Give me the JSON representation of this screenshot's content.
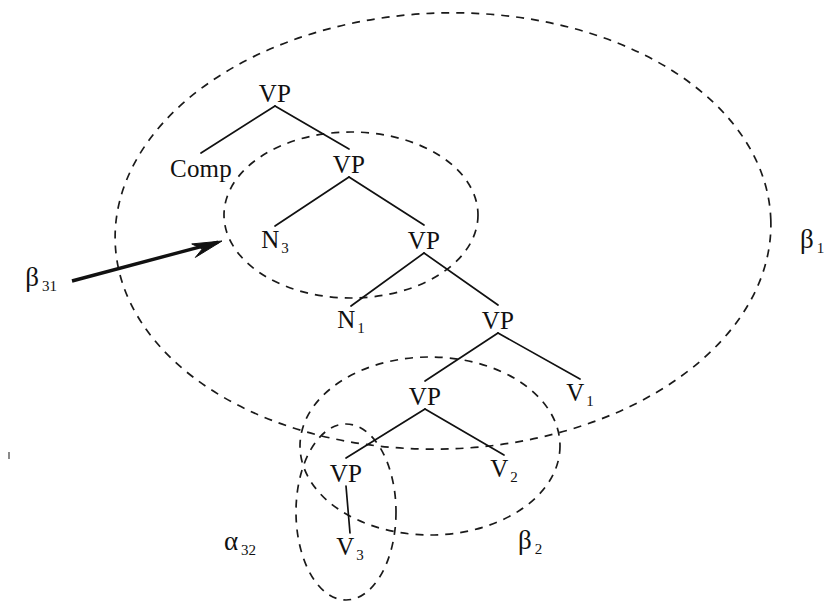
{
  "figure": {
    "background_color": "#ffffff",
    "ink_color": "#111111",
    "width": 840,
    "height": 613
  },
  "tree_nodes": [
    {
      "id": "vp-root",
      "label": "VP",
      "sub": "",
      "x": 275,
      "y": 93
    },
    {
      "id": "comp",
      "label": "Comp",
      "sub": "",
      "x": 201,
      "y": 168
    },
    {
      "id": "vp-2",
      "label": "VP",
      "sub": "",
      "x": 349,
      "y": 164
    },
    {
      "id": "n3",
      "label": "N",
      "sub": "3",
      "x": 275,
      "y": 241
    },
    {
      "id": "vp-3",
      "label": "VP",
      "sub": "",
      "x": 424,
      "y": 240
    },
    {
      "id": "n1",
      "label": "N",
      "sub": "1",
      "x": 351,
      "y": 321
    },
    {
      "id": "vp-4",
      "label": "VP",
      "sub": "",
      "x": 498,
      "y": 320
    },
    {
      "id": "vp-5",
      "label": "VP",
      "sub": "",
      "x": 425,
      "y": 396
    },
    {
      "id": "v1",
      "label": "V",
      "sub": "1",
      "x": 580,
      "y": 394
    },
    {
      "id": "vp-6",
      "label": "VP",
      "sub": "",
      "x": 346,
      "y": 473
    },
    {
      "id": "v2",
      "label": "V",
      "sub": "2",
      "x": 504,
      "y": 470
    },
    {
      "id": "v3",
      "label": "V",
      "sub": "3",
      "x": 350,
      "y": 548
    }
  ],
  "tree_edges": [
    {
      "id": "edge-vproot-comp",
      "from": "vp-root",
      "to": "comp"
    },
    {
      "id": "edge-vproot-vp2",
      "from": "vp-root",
      "to": "vp-2"
    },
    {
      "id": "edge-vp2-n3",
      "from": "vp-2",
      "to": "n3"
    },
    {
      "id": "edge-vp2-vp3",
      "from": "vp-2",
      "to": "vp-3"
    },
    {
      "id": "edge-vp3-n1",
      "from": "vp-3",
      "to": "n1"
    },
    {
      "id": "edge-vp3-vp4",
      "from": "vp-3",
      "to": "vp-4"
    },
    {
      "id": "edge-vp4-vp5",
      "from": "vp-4",
      "to": "vp-5"
    },
    {
      "id": "edge-vp4-v1",
      "from": "vp-4",
      "to": "v1"
    },
    {
      "id": "edge-vp5-vp6",
      "from": "vp-5",
      "to": "vp-6"
    },
    {
      "id": "edge-vp5-v2",
      "from": "vp-5",
      "to": "v2"
    },
    {
      "id": "edge-vp6-v3",
      "from": "vp-6",
      "to": "v3"
    }
  ],
  "regions": [
    {
      "id": "beta1",
      "name": "beta-1-region",
      "cx": 443,
      "cy": 231,
      "rx": 328,
      "ry": 218,
      "rotate": -2
    },
    {
      "id": "beta31",
      "name": "beta-31-region",
      "cx": 351,
      "cy": 215,
      "rx": 127,
      "ry": 83,
      "rotate": 0
    },
    {
      "id": "beta2",
      "name": "beta-2-region",
      "cx": 430,
      "cy": 446,
      "rx": 130,
      "ry": 89,
      "rotate": 0
    },
    {
      "id": "alpha32",
      "name": "alpha-32-region",
      "cx": 346,
      "cy": 512,
      "rx": 50,
      "ry": 88,
      "rotate": 0
    }
  ],
  "set_labels": [
    {
      "id": "beta1-label",
      "label": "β",
      "sub": "1",
      "x": 812,
      "y": 241
    },
    {
      "id": "beta31-label",
      "label": "β",
      "sub": "31",
      "x": 41,
      "y": 279
    },
    {
      "id": "beta2-label",
      "label": "β",
      "sub": "2",
      "x": 530,
      "y": 542
    },
    {
      "id": "alpha32-label",
      "label": "α",
      "sub": "32",
      "x": 240,
      "y": 543
    }
  ],
  "arrow": {
    "id": "beta31-arrow",
    "name": "beta-31-pointer-arrow",
    "from_x": 72,
    "from_y": 281,
    "to_x": 222,
    "to_y": 241
  }
}
